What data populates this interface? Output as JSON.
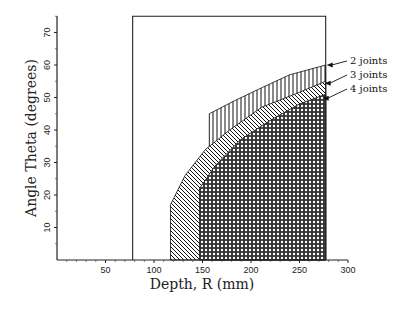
{
  "chart_data": {
    "type": "area",
    "title": "",
    "xlabel": "Depth, R (mm)",
    "ylabel": "Angle Theta (degrees)",
    "xlim": [
      0,
      300
    ],
    "ylim": [
      0,
      75
    ],
    "x_ticks": [
      50,
      100,
      150,
      200,
      250,
      300
    ],
    "y_ticks": [
      10,
      20,
      30,
      40,
      50,
      60,
      70
    ],
    "grid": false,
    "legend_position": "right, arrow-annotated",
    "bounding_region": {
      "r_min": 78,
      "r_max": 277,
      "theta_max": 75
    },
    "series": [
      {
        "name": "2 joints",
        "pattern": "vertical-lines",
        "left_edge_r": 157,
        "upper_boundary": [
          [
            157,
            45
          ],
          [
            183,
            49
          ],
          [
            211,
            53
          ],
          [
            240,
            57
          ],
          [
            277,
            60
          ]
        ]
      },
      {
        "name": "3 joints",
        "pattern": "diagonal-lines",
        "left_edge_r": 117,
        "upper_boundary": [
          [
            117,
            17
          ],
          [
            132,
            26
          ],
          [
            153,
            34
          ],
          [
            178,
            40
          ],
          [
            211,
            47
          ],
          [
            245,
            51
          ],
          [
            277,
            55
          ]
        ]
      },
      {
        "name": "4 joints",
        "pattern": "crosshatch",
        "left_edge_r": 147,
        "upper_boundary": [
          [
            147,
            22
          ],
          [
            163,
            29
          ],
          [
            189,
            37
          ],
          [
            220,
            43
          ],
          [
            250,
            48
          ],
          [
            277,
            51
          ]
        ]
      }
    ]
  },
  "axes": {
    "x_title": "Depth, R (mm)",
    "y_title": "Angle Theta (degrees)",
    "x_tick_labels": [
      "50",
      "100",
      "150",
      "200",
      "250",
      "300"
    ],
    "y_tick_labels": [
      "10",
      "20",
      "30",
      "40",
      "50",
      "60",
      "70"
    ]
  },
  "legend": {
    "items": [
      {
        "label": "2 joints"
      },
      {
        "label": "3 joints"
      },
      {
        "label": "4 joints"
      }
    ]
  }
}
